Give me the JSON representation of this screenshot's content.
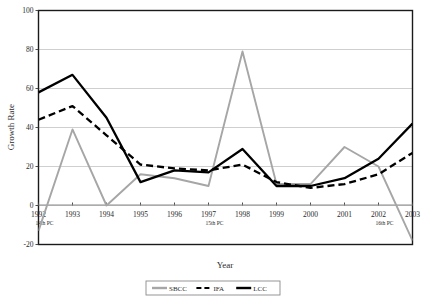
{
  "chart_data": {
    "type": "line",
    "title": "",
    "xlabel": "Year",
    "ylabel": "Growth Rate",
    "ylim": [
      -20,
      100
    ],
    "yticks": [
      -20,
      0,
      20,
      40,
      60,
      80,
      100
    ],
    "grid": "horizontal",
    "legend_position": "bottom-center",
    "categories": [
      "1992",
      "1993",
      "1994",
      "1995",
      "1996",
      "1997",
      "1998",
      "1999",
      "2000",
      "2001",
      "2002",
      "2003"
    ],
    "category_sublabels": [
      "14th PC",
      "",
      "",
      "",
      "",
      "15th PC",
      "",
      "",
      "",
      "",
      "16th PC",
      ""
    ],
    "series": [
      {
        "name": "SBCC",
        "color": "#a6a6a6",
        "style": "solid",
        "values": [
          -13,
          39,
          0,
          16,
          14,
          10,
          79,
          11,
          11,
          30,
          20,
          -18
        ]
      },
      {
        "name": "IFA",
        "color": "#000000",
        "style": "dashed",
        "values": [
          44,
          51,
          36,
          21,
          19,
          18,
          21,
          12,
          9,
          11,
          16,
          27
        ]
      },
      {
        "name": "LCC",
        "color": "#000000",
        "style": "solid",
        "values": [
          58,
          67,
          45,
          12,
          18,
          17,
          29,
          10,
          10,
          14,
          24,
          42
        ]
      }
    ]
  },
  "axis": {
    "y_title": "Growth Rate",
    "x_title": "Year",
    "y_tick_labels": [
      "100",
      "80",
      "60",
      "40",
      "20",
      "0",
      "-20"
    ],
    "x_tick_labels": [
      "1992",
      "1993",
      "1994",
      "1995",
      "1996",
      "1997",
      "1998",
      "1999",
      "2000",
      "2001",
      "2002",
      "2003"
    ],
    "x_sub_labels": [
      {
        "index": 0,
        "text": "14th PC"
      },
      {
        "index": 5,
        "text": "15th PC"
      },
      {
        "index": 10,
        "text": "16th PC"
      }
    ]
  },
  "legend": {
    "items": [
      {
        "label": "SBCC",
        "color": "#a6a6a6",
        "style": "solid"
      },
      {
        "label": "IFA",
        "color": "#000000",
        "style": "dashed"
      },
      {
        "label": "LCC",
        "color": "#000000",
        "style": "solid"
      }
    ]
  },
  "colors": {
    "plot_border": "#1a1a1a",
    "gridline": "#c9c9c9",
    "background": "#ffffff",
    "sbcc": "#a6a6a6",
    "ifa": "#000000",
    "lcc": "#000000"
  }
}
